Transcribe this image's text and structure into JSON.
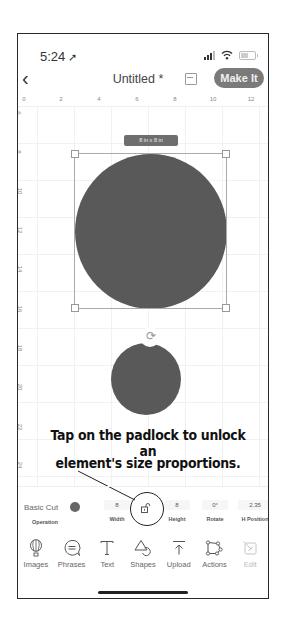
{
  "status_bar": {
    "time": "5:24",
    "location_arrow": "➚"
  },
  "header": {
    "back_icon": "‹",
    "title": "Untitled *",
    "save_icon": "save-icon",
    "make_it_label": "Make It"
  },
  "ruler": {
    "horizontal": [
      "0",
      "2",
      "4",
      "6",
      "8",
      "10",
      "12"
    ],
    "vertical": [
      "6",
      "8",
      "10",
      "12",
      "14",
      "16",
      "18",
      "20",
      "22",
      "24"
    ]
  },
  "canvas": {
    "selected_size_label": "8 in x 8 in",
    "rotate_icon": "⟳",
    "shapes": [
      {
        "type": "circle",
        "selected": true,
        "color": "#595959"
      },
      {
        "type": "circle",
        "selected": false,
        "color": "#595959"
      }
    ]
  },
  "annotation": {
    "line1": "Tap on the padlock to unlock an",
    "line2": "element's size proportions."
  },
  "properties": {
    "operation_value": "Basic Cut",
    "operation_label": "Operation",
    "operation_color": "#666666",
    "width_value": "8",
    "width_label": "Width",
    "height_value": "8",
    "height_label": "Height",
    "rotate_value": "0°",
    "rotate_label": "Rotate",
    "hpos_value": "2.35",
    "hpos_label": "H Position"
  },
  "toolbar": {
    "items": [
      {
        "label": "Images",
        "icon": "balloon-icon"
      },
      {
        "label": "Phrases",
        "icon": "speech-bubble-icon"
      },
      {
        "label": "Text",
        "icon": "text-icon"
      },
      {
        "label": "Shapes",
        "icon": "shapes-icon"
      },
      {
        "label": "Upload",
        "icon": "upload-icon"
      },
      {
        "label": "Actions",
        "icon": "actions-icon"
      },
      {
        "label": "Edit",
        "icon": "edit-icon",
        "disabled": true
      }
    ]
  }
}
